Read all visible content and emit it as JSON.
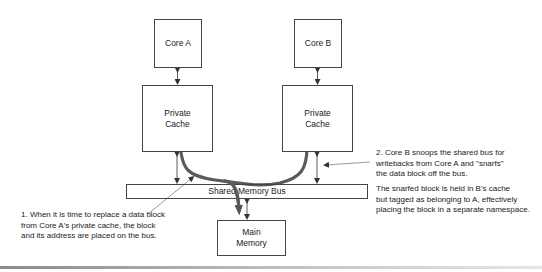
{
  "diagram": {
    "type": "cache-snarfing architecture",
    "nodes": {
      "core_a": {
        "label": "Core A"
      },
      "core_b": {
        "label": "Core B"
      },
      "cache_a": {
        "label": "Private\nCache"
      },
      "cache_b": {
        "label": "Private\nCache"
      },
      "bus": {
        "label": "Shared Memory Bus"
      },
      "main_memory": {
        "label": "Main\nMemory"
      }
    },
    "edges": [
      {
        "from": "core_a",
        "to": "cache_a",
        "style": "bidirectional"
      },
      {
        "from": "core_b",
        "to": "cache_b",
        "style": "bidirectional"
      },
      {
        "from": "cache_a",
        "to": "bus",
        "style": "bidirectional"
      },
      {
        "from": "cache_b",
        "to": "bus",
        "style": "bidirectional"
      },
      {
        "from": "bus",
        "to": "main_memory",
        "style": "bidirectional"
      },
      {
        "from": "cache_a",
        "to": "cache_b",
        "style": "thick-flow",
        "via": "bus"
      },
      {
        "from": "cache_a",
        "to": "main_memory",
        "style": "thick-flow",
        "via": "bus"
      }
    ],
    "annotations": {
      "step1": "1. When it is time to replace a data block\nfrom Core A's private cache, the block\nand its address are placed on the bus.",
      "step2": "2. Core B snoops the shared bus for\nwritebacks from Core A and \"snarfs\"\nthe data block off the bus.",
      "step3": "The snarfed block is held in B's cache\nbut tagged as belonging to A, effectively\nplacing the block in a separate namespace."
    },
    "colors": {
      "box_border": "#444444",
      "flow_arrow": "#5a5a5a",
      "text": "#222222"
    }
  }
}
